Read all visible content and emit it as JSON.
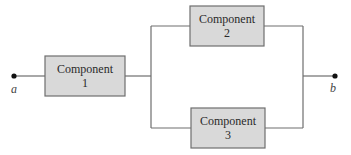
{
  "diagram": {
    "type": "reliability-block-diagram",
    "terminals": {
      "start": "a",
      "end": "b"
    },
    "components": [
      {
        "line1": "Component",
        "line2": "1"
      },
      {
        "line1": "Component",
        "line2": "2"
      },
      {
        "line1": "Component",
        "line2": "3"
      }
    ],
    "connections": [
      {
        "from": "a",
        "to": "Component 1",
        "type": "series"
      },
      {
        "from": "Component 1",
        "to": "Component 2",
        "type": "parallel-branch"
      },
      {
        "from": "Component 1",
        "to": "Component 3",
        "type": "parallel-branch"
      },
      {
        "from": "Component 2",
        "to": "b",
        "type": "parallel-join"
      },
      {
        "from": "Component 3",
        "to": "b",
        "type": "parallel-join"
      }
    ]
  }
}
